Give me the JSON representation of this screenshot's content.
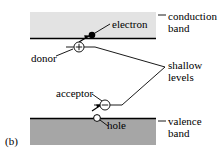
{
  "figure": {
    "panel_label": "(b)",
    "title_absent": true
  },
  "labels": {
    "conduction_line1": "conduction",
    "conduction_line2": "band",
    "electron": "electron",
    "donor": "donor",
    "shallow_line1": "shallow",
    "shallow_line2": "levels",
    "acceptor": "acceptor",
    "hole": "hole",
    "valence_line1": "valence",
    "valence_line2": "band"
  },
  "bands": {
    "conduction": {
      "name": "conduction band",
      "fill": "#e3e3e3",
      "edge_color": "#000000",
      "x": 30,
      "y": 12,
      "width": 126,
      "height": 26,
      "edge": "bottom"
    },
    "valence": {
      "name": "valence band",
      "fill": "#a6a6a6",
      "edge_color": "#000000",
      "x": 30,
      "y": 118,
      "width": 126,
      "height": 27,
      "edge": "top"
    }
  },
  "levels": {
    "donor": {
      "name": "donor level",
      "symbol": "+",
      "charge": "positive",
      "marker_fill": "#ffffff",
      "marker_stroke": "#000000",
      "cx": 79,
      "cy": 47,
      "r": 5,
      "line_x1": 66,
      "line_x2": 95
    },
    "acceptor": {
      "name": "acceptor level",
      "symbol": "−",
      "charge": "negative",
      "marker_fill": "#ffffff",
      "marker_stroke": "#000000",
      "cx": 105,
      "cy": 105,
      "r": 5,
      "line_x1": 94,
      "line_x2": 122
    }
  },
  "carriers": {
    "electron": {
      "name": "electron",
      "fill": "#000000",
      "cx": 92,
      "cy": 35,
      "r": 3.2
    },
    "hole": {
      "name": "hole",
      "fill": "#ffffff",
      "stroke": "#000000",
      "cx": 97,
      "cy": 118,
      "r": 3.2
    }
  },
  "colors": {
    "ink": "#000000",
    "conduction_fill": "#e3e3e3",
    "valence_fill": "#a6a6a6",
    "background": "#ffffff"
  }
}
